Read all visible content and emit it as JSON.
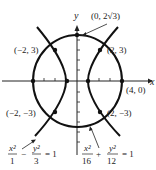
{
  "diagram": {
    "type": "conic-sections",
    "axes": {
      "x_label": "x",
      "y_label": "y"
    },
    "curves": [
      {
        "name": "hyperbola",
        "equation": {
          "t1_num": "x²",
          "t1_den": "1",
          "op": "−",
          "t2_num": "y²",
          "t2_den": "3",
          "rhs": "= 1"
        }
      },
      {
        "name": "ellipse",
        "equation": {
          "t1_num": "x²",
          "t1_den": "16",
          "op": "+",
          "t2_num": "y²",
          "t2_den": "12",
          "rhs": "= 1"
        }
      }
    ],
    "points": {
      "top": "(0, 2√3)",
      "upper_left": "(−2, 3)",
      "upper_right": "(2, 3)",
      "lower_left": "(−2, −3)",
      "lower_right": "(2, −3)",
      "right_vertex": "(4, 0)"
    }
  }
}
